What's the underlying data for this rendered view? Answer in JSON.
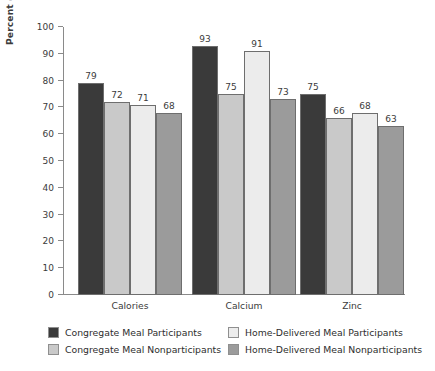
{
  "chart_data": {
    "type": "bar",
    "title": "",
    "subtitle": "",
    "xlabel": "",
    "ylabel": "Percent of Recommended Intake",
    "ylim": [
      0,
      100
    ],
    "yticks": [
      0,
      10,
      20,
      30,
      40,
      50,
      60,
      70,
      80,
      90,
      100
    ],
    "grid": false,
    "legend_position": "bottom",
    "categories": [
      "Calories",
      "Calcium",
      "Zinc"
    ],
    "series": [
      {
        "name": "Congregate Meal Participants",
        "color": "#3a3a3a",
        "values": [
          79,
          93,
          75
        ]
      },
      {
        "name": "Congregate Meal Nonparticipants",
        "color": "#c9c9c9",
        "values": [
          72,
          75,
          66
        ]
      },
      {
        "name": "Home-Delivered Meal Participants",
        "color": "#ececec",
        "values": [
          71,
          91,
          68
        ]
      },
      {
        "name": "Home-Delivered Meal Nonparticipants",
        "color": "#9b9b9b",
        "values": [
          68,
          73,
          63
        ]
      }
    ]
  },
  "colors": {
    "background": "#ffffff",
    "axis": "#8a8a8a",
    "text": "#3b3b3b",
    "bar_outline": "#6e6e6e"
  }
}
